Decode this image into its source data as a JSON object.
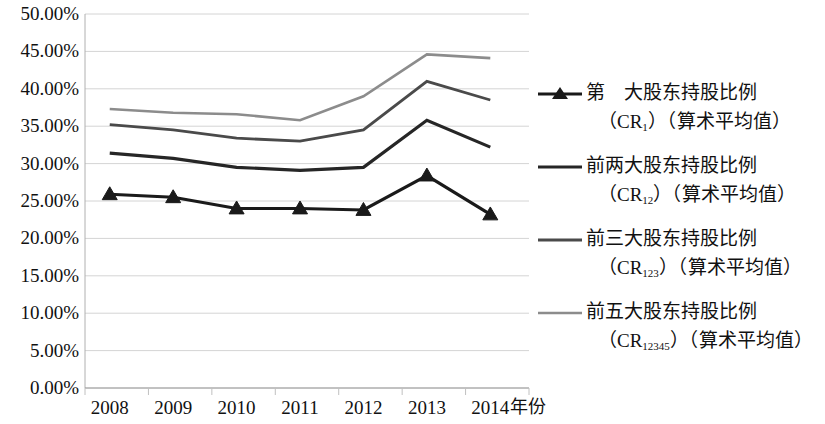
{
  "chart_data": {
    "type": "line",
    "title": "",
    "subtitle": "",
    "xlabel": "年份",
    "ylabel": "",
    "categories": [
      "2008",
      "2009",
      "2010",
      "2011",
      "2012",
      "2013",
      "2014"
    ],
    "x": [
      2008,
      2009,
      2010,
      2011,
      2012,
      2013,
      2014
    ],
    "ylim": [
      0,
      50
    ],
    "ytick_labels": [
      "0.00%",
      "5.00%",
      "10.00%",
      "15.00%",
      "20.00%",
      "25.00%",
      "30.00%",
      "35.00%",
      "40.00%",
      "45.00%",
      "50.00%"
    ],
    "ytick_values": [
      0,
      5,
      10,
      15,
      20,
      25,
      30,
      35,
      40,
      45,
      50
    ],
    "grid": true,
    "grid_axis": "y",
    "legend_position": "right",
    "units": "percent",
    "series": [
      {
        "name": "第 大股东持股比例（CR1）（算术平均值）",
        "key": "CR1",
        "label_line1": "第　大股东持股比例",
        "label_line2_pre": "（CR",
        "label_line2_sub": "1",
        "label_line2_post": "）（算术平均值）",
        "color": "#1a1a1a",
        "width": 3.2,
        "marker": "triangle",
        "values": [
          25.9,
          25.5,
          24.0,
          24.0,
          23.8,
          28.4,
          23.2
        ]
      },
      {
        "name": "前两大股东持股比例（CR12）（算术平均值）",
        "key": "CR12",
        "label_line1": "前两大股东持股比例",
        "label_line2_pre": "（CR",
        "label_line2_sub": "12",
        "label_line2_post": "）（算术平均值）",
        "color": "#262626",
        "width": 3.2,
        "marker": "none",
        "values": [
          31.4,
          30.7,
          29.5,
          29.1,
          29.5,
          35.8,
          32.2
        ]
      },
      {
        "name": "前三大股东持股比例（CR123）（算术平均值）",
        "key": "CR123",
        "label_line1": "前三大股东持股比例",
        "label_line2_pre": "（CR",
        "label_line2_sub": "123",
        "label_line2_post": "）（算术平均值）",
        "color": "#4a4a4a",
        "width": 2.8,
        "marker": "none",
        "values": [
          35.2,
          34.5,
          33.4,
          33.0,
          34.5,
          41.0,
          38.5
        ]
      },
      {
        "name": "前五大股东持股比例（CR12345）（算术平均值）",
        "key": "CR12345",
        "label_line1": "前五大股东持股比例",
        "label_line2_pre": "（CR",
        "label_line2_sub": "12345",
        "label_line2_post": "）（算术平均值）",
        "color": "#8c8c8c",
        "width": 2.6,
        "marker": "none",
        "values": [
          37.3,
          36.8,
          36.6,
          35.8,
          39.0,
          44.6,
          44.1
        ]
      }
    ]
  },
  "axis": {
    "xlabel": "年份",
    "ytick_labels": [
      "50.00%",
      "45.00%",
      "40.00%",
      "35.00%",
      "30.00%",
      "25.00%",
      "20.00%",
      "15.00%",
      "10.00%",
      "5.00%",
      "0.00%"
    ],
    "xtick_labels": [
      "2008",
      "2009",
      "2010",
      "2011",
      "2012",
      "2013",
      "2014"
    ]
  }
}
